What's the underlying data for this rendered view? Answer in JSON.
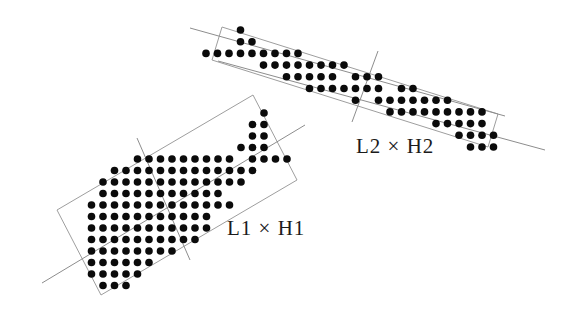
{
  "figure": {
    "background": "#ffffff",
    "dot_color": "#0b0b0b",
    "line_color": "#8d8d8d",
    "box_color": "#9e9e9e",
    "regions": [
      {
        "id": "L1",
        "label": "L1 × H1",
        "label_pos": {
          "x": 227,
          "y": 218
        },
        "rect": [
          [
            57,
            210
          ],
          [
            253,
            95
          ],
          [
            297,
            180
          ],
          [
            101,
            295
          ]
        ],
        "long_lines": [
          [
            [
              42,
              283
            ],
            [
              305,
              125
            ]
          ]
        ],
        "perp_line": [
          [
            137,
            138
          ],
          [
            190,
            260
          ]
        ],
        "grid": {
          "x0": 57,
          "y0": 113,
          "dx": 11.5,
          "dy": 11.5,
          "r": 3.8
        },
        "rows": [
          {
            "j": 0,
            "runs": [
              [
                18,
                18
              ]
            ]
          },
          {
            "j": 1,
            "runs": [
              [
                17,
                18
              ]
            ]
          },
          {
            "j": 2,
            "runs": [
              [
                17,
                18
              ]
            ]
          },
          {
            "j": 3,
            "runs": [
              [
                16,
                18
              ]
            ]
          },
          {
            "j": 4,
            "runs": [
              [
                7,
                15
              ],
              [
                17,
                20
              ]
            ]
          },
          {
            "j": 5,
            "runs": [
              [
                5,
                17
              ]
            ]
          },
          {
            "j": 6,
            "runs": [
              [
                4,
                16
              ]
            ]
          },
          {
            "j": 7,
            "runs": [
              [
                4,
                14
              ]
            ]
          },
          {
            "j": 8,
            "runs": [
              [
                3,
                15
              ]
            ]
          },
          {
            "j": 9,
            "runs": [
              [
                3,
                13
              ]
            ]
          },
          {
            "j": 10,
            "runs": [
              [
                3,
                13
              ]
            ]
          },
          {
            "j": 11,
            "runs": [
              [
                3,
                12
              ]
            ]
          },
          {
            "j": 12,
            "runs": [
              [
                3,
                10
              ]
            ]
          },
          {
            "j": 13,
            "runs": [
              [
                3,
                8
              ]
            ]
          },
          {
            "j": 14,
            "runs": [
              [
                3,
                7
              ]
            ]
          },
          {
            "j": 15,
            "runs": [
              [
                4,
                6
              ]
            ]
          }
        ]
      },
      {
        "id": "L2",
        "label": "L2 × H2",
        "label_pos": {
          "x": 356,
          "y": 136
        },
        "rect": [
          [
            222,
            27
          ],
          [
            498,
            114
          ],
          [
            488,
            147
          ],
          [
            212,
            60
          ]
        ],
        "long_lines": [
          [
            [
              190,
              28
            ],
            [
              505,
              116
            ]
          ],
          [
            [
              218,
              61
            ],
            [
              545,
              150
            ]
          ]
        ],
        "perp_line": [
          [
            378,
            51
          ],
          [
            352,
            122
          ]
        ],
        "grid": {
          "x0": 206,
          "y0": 30,
          "dx": 11.5,
          "dy": 11.7,
          "r": 3.8
        },
        "rows": [
          {
            "j": 0,
            "runs": [
              [
                3,
                3
              ]
            ]
          },
          {
            "j": 1,
            "runs": [
              [
                3,
                4
              ]
            ]
          },
          {
            "j": 2,
            "runs": [
              [
                0,
                8
              ]
            ]
          },
          {
            "j": 3,
            "runs": [
              [
                5,
                12
              ]
            ]
          },
          {
            "j": 4,
            "runs": [
              [
                7,
                11
              ],
              [
                13,
                15
              ]
            ]
          },
          {
            "j": 5,
            "runs": [
              [
                9,
                15
              ],
              [
                17,
                18
              ]
            ]
          },
          {
            "j": 6,
            "runs": [
              [
                13,
                13
              ],
              [
                15,
                21
              ]
            ]
          },
          {
            "j": 7,
            "runs": [
              [
                16,
                24
              ]
            ]
          },
          {
            "j": 8,
            "runs": [
              [
                20,
                24
              ]
            ]
          },
          {
            "j": 9,
            "runs": [
              [
                22,
                25
              ]
            ]
          },
          {
            "j": 10,
            "runs": [
              [
                23,
                25
              ]
            ]
          }
        ]
      }
    ]
  }
}
